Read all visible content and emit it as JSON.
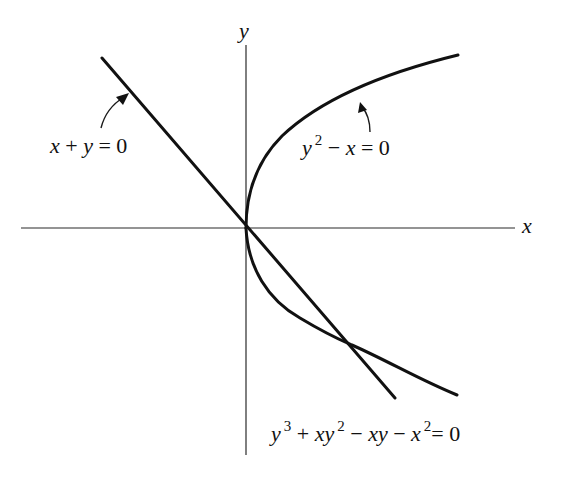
{
  "figure": {
    "axes": {
      "x_label": "x",
      "y_label": "y"
    },
    "curves": [
      {
        "id": "line",
        "label": "x + y = 0",
        "parts": {
          "a": "x",
          "op1": " + ",
          "b": "y",
          "rest": " = 0"
        }
      },
      {
        "id": "parabola",
        "label": "y² − x = 0",
        "parts": {
          "base": "y",
          "exp": "2",
          "op": " − ",
          "var": "x",
          "rest": " = 0"
        }
      },
      {
        "id": "cubic",
        "label": "y³ + xy² − xy − x² = 0",
        "parts": {
          "t1_base": "y",
          "t1_exp": "3",
          "op1": " + ",
          "t2_base": "xy",
          "t2_exp": "2",
          "op2": " − ",
          "t3": "xy",
          "op3": " − ",
          "t4_base": "x",
          "t4_exp": "2",
          "rest": "= 0"
        }
      }
    ],
    "colors": {
      "ink": "#111111",
      "background": "#ffffff"
    }
  }
}
